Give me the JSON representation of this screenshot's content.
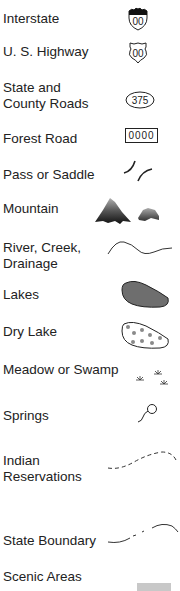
{
  "legend": {
    "items": [
      {
        "label": "Interstate",
        "symbol": "interstate-shield",
        "shield_text": "00"
      },
      {
        "label": "U. S. Highway",
        "symbol": "us-highway-shield",
        "shield_text": "00"
      },
      {
        "label": "State and\nCounty Roads",
        "symbol": "state-road-oval",
        "shield_text": "375"
      },
      {
        "label": "Forest Road",
        "symbol": "forest-road-box",
        "shield_text": "0000"
      },
      {
        "label": "Pass or Saddle",
        "symbol": "pass-saddle"
      },
      {
        "label": "Mountain",
        "symbol": "mountain"
      },
      {
        "label": "River, Creek,\nDrainage",
        "symbol": "river-line"
      },
      {
        "label": "Lakes",
        "symbol": "lake-fill"
      },
      {
        "label": "Dry Lake",
        "symbol": "dry-lake-dotted"
      },
      {
        "label": "Meadow or Swamp",
        "symbol": "meadow-swamp"
      },
      {
        "label": "Springs",
        "symbol": "spring"
      },
      {
        "label": "Indian\nReservations",
        "symbol": "reservation-dashed-line"
      },
      {
        "label": "State Boundary",
        "symbol": "state-boundary-line"
      },
      {
        "label": "Scenic Areas",
        "symbol": "scenic-area-fill"
      }
    ]
  },
  "colors": {
    "text": "#222222",
    "lake_fill": "#6e6e6e",
    "dry_lake_dots": "#8a8a8a",
    "scenic_fill": "#c8c8c8",
    "line": "#333333"
  }
}
